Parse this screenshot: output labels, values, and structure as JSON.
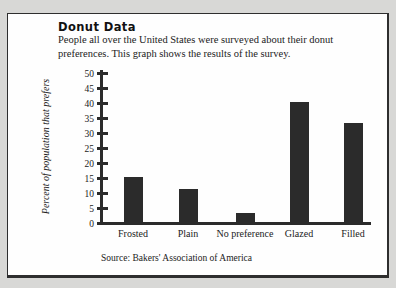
{
  "page": {
    "background_color": "#d8d8d6",
    "panel_color": "#fefefe",
    "border_color": "#2e2e2e",
    "ink_color": "#2b2b2b"
  },
  "header": {
    "title": "Donut Data",
    "description": "People all over the United States were surveyed about their donut preferences. This graph shows the results of the survey."
  },
  "chart_data": {
    "type": "bar",
    "title": "Donut Data",
    "categories": [
      "Frosted",
      "Plain",
      "No preference",
      "Glazed",
      "Filled"
    ],
    "values": [
      15,
      11,
      3,
      40,
      33
    ],
    "xlabel": "",
    "ylabel": "Percent of population that prefers",
    "ylim": [
      0,
      50
    ],
    "ytick_step": 5,
    "bar_color": "#2b2b2b",
    "grid": false,
    "legend": false
  },
  "footer": {
    "source": "Source: Bakers' Association of America"
  }
}
